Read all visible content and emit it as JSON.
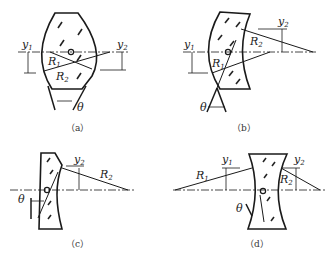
{
  "panels": [
    {
      "id": "a",
      "caption": "（a）",
      "labels": {
        "y1": "y",
        "y1_sub": "1",
        "y2": "y",
        "y2_sub": "2",
        "R1": "R",
        "R1_sub": "1",
        "R2": "R",
        "R2_sub": "2",
        "theta": "θ"
      }
    },
    {
      "id": "b",
      "caption": "（b）",
      "labels": {
        "y1": "y",
        "y1_sub": "1",
        "y2": "y",
        "y2_sub": "2",
        "R1": "R",
        "R1_sub": "1",
        "R2": "R",
        "R2_sub": "2",
        "theta": "θ"
      }
    },
    {
      "id": "c",
      "caption": "（c）",
      "labels": {
        "y2": "y",
        "y2_sub": "2",
        "R2": "R",
        "R2_sub": "2",
        "theta": "θ"
      }
    },
    {
      "id": "d",
      "caption": "（d）",
      "labels": {
        "y1": "y",
        "y1_sub": "1",
        "y2": "y",
        "y2_sub": "2",
        "R1": "R",
        "R1_sub": "1",
        "R2": "R",
        "R2_sub": "2",
        "theta": "θ"
      }
    }
  ]
}
